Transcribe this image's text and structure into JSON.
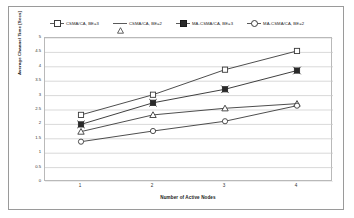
{
  "chart_data": {
    "type": "line",
    "title": "",
    "xlabel": "Number of Active Nodes",
    "ylabel": "Average Channel Time [Secs]",
    "categories": [
      "1",
      "2",
      "3",
      "4"
    ],
    "x": [
      1,
      2,
      3,
      4
    ],
    "ylim": [
      0,
      5
    ],
    "ytick_step": 0.5,
    "yticks": [
      "0",
      "0.5",
      "1",
      "1.5",
      "2",
      "2.5",
      "3",
      "3.5",
      "4",
      "4.5",
      "5"
    ],
    "grid": "horizontal",
    "legend_position": "top",
    "series": [
      {
        "name": "CSMA/CA, BE=3",
        "marker": "square-open",
        "color": "#3a3a3a",
        "values": [
          2.33,
          3.03,
          3.9,
          4.55
        ]
      },
      {
        "name": "CSMA/CA, BE=2",
        "marker": "triangle-open",
        "color": "#3a3a3a",
        "values": [
          1.75,
          2.33,
          2.56,
          2.72
        ]
      },
      {
        "name": "MA-CSMA/CA, BE=3",
        "marker": "square-filled",
        "color": "#2a2a2a",
        "values": [
          2.0,
          2.75,
          3.22,
          3.87
        ]
      },
      {
        "name": "MA-CSMA/CA, BE=2",
        "marker": "circle-open",
        "color": "#3a3a3a",
        "values": [
          1.4,
          1.77,
          2.11,
          2.65
        ]
      }
    ]
  }
}
